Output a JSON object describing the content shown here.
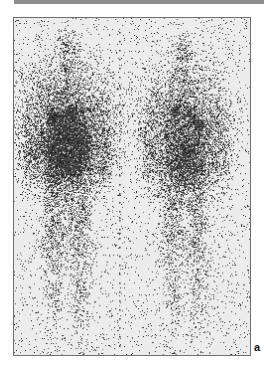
{
  "figure": {
    "panel_label": "a",
    "colors": {
      "top_rule": "#8e8e8e",
      "frame_border": "#6f6f6f",
      "background": "#ececec",
      "counts": "#1a1a1a"
    },
    "midline": {
      "x": 106,
      "dot_spacing": 9,
      "dot_start": 14,
      "dot_end": 335
    },
    "views": [
      {
        "name": "anterior-view",
        "center_x": 53,
        "blobs": [
          {
            "cx": 53,
            "cy": 30,
            "rx": 9,
            "ry": 15,
            "density": 0.35
          },
          {
            "cx": 53,
            "cy": 52,
            "rx": 6,
            "ry": 8,
            "density": 0.25
          },
          {
            "cx": 53,
            "cy": 110,
            "rx": 40,
            "ry": 55,
            "density": 0.75
          },
          {
            "cx": 53,
            "cy": 140,
            "rx": 30,
            "ry": 30,
            "density": 0.6
          },
          {
            "cx": 40,
            "cy": 210,
            "rx": 12,
            "ry": 50,
            "density": 0.35
          },
          {
            "cx": 66,
            "cy": 210,
            "rx": 12,
            "ry": 50,
            "density": 0.35
          },
          {
            "cx": 40,
            "cy": 285,
            "rx": 8,
            "ry": 35,
            "density": 0.18
          },
          {
            "cx": 66,
            "cy": 285,
            "rx": 8,
            "ry": 35,
            "density": 0.18
          },
          {
            "cx": 14,
            "cy": 130,
            "rx": 6,
            "ry": 45,
            "density": 0.2
          },
          {
            "cx": 92,
            "cy": 130,
            "rx": 6,
            "ry": 45,
            "density": 0.2
          }
        ],
        "hotspots": [
          {
            "cx": 40,
            "cy": 100,
            "r": 5
          },
          {
            "cx": 58,
            "cy": 94,
            "r": 4
          },
          {
            "cx": 48,
            "cy": 138,
            "r": 6
          }
        ]
      },
      {
        "name": "posterior-view",
        "center_x": 170,
        "blobs": [
          {
            "cx": 170,
            "cy": 32,
            "rx": 9,
            "ry": 15,
            "density": 0.3
          },
          {
            "cx": 170,
            "cy": 54,
            "rx": 6,
            "ry": 8,
            "density": 0.22
          },
          {
            "cx": 172,
            "cy": 112,
            "rx": 38,
            "ry": 55,
            "density": 0.65
          },
          {
            "cx": 172,
            "cy": 150,
            "rx": 28,
            "ry": 28,
            "density": 0.45
          },
          {
            "cx": 160,
            "cy": 215,
            "rx": 11,
            "ry": 50,
            "density": 0.3
          },
          {
            "cx": 184,
            "cy": 215,
            "rx": 11,
            "ry": 50,
            "density": 0.3
          },
          {
            "cx": 160,
            "cy": 290,
            "rx": 8,
            "ry": 35,
            "density": 0.15
          },
          {
            "cx": 184,
            "cy": 290,
            "rx": 8,
            "ry": 35,
            "density": 0.15
          },
          {
            "cx": 134,
            "cy": 130,
            "rx": 6,
            "ry": 45,
            "density": 0.18
          },
          {
            "cx": 210,
            "cy": 130,
            "rx": 6,
            "ry": 45,
            "density": 0.18
          }
        ],
        "hotspots": [
          {
            "cx": 162,
            "cy": 94,
            "r": 4
          },
          {
            "cx": 176,
            "cy": 96,
            "r": 3
          },
          {
            "cx": 186,
            "cy": 106,
            "r": 4
          }
        ]
      }
    ]
  }
}
